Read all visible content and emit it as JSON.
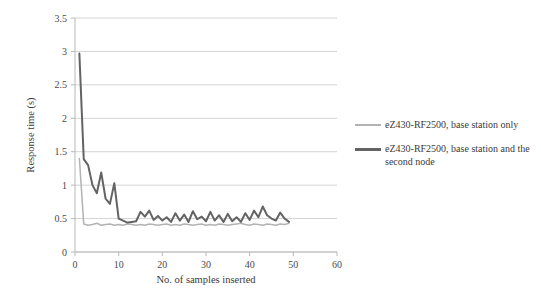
{
  "chart_data": {
    "type": "line",
    "title": "",
    "xlabel": "No. of samples inserted",
    "ylabel": "Response time (s)",
    "xlim": [
      0,
      60
    ],
    "ylim": [
      0,
      3.5
    ],
    "xticks": [
      "0",
      "10",
      "20",
      "30",
      "40",
      "50",
      "60"
    ],
    "xtick_values": [
      0,
      10,
      20,
      30,
      40,
      50,
      60
    ],
    "yticks": [
      "0",
      "0.5",
      "1",
      "1.5",
      "2",
      "2.5",
      "3",
      "3.5"
    ],
    "ytick_values": [
      0,
      0.5,
      1,
      1.5,
      2,
      2.5,
      3,
      3.5
    ],
    "grid": "horizontal",
    "legend_position": "right",
    "series": [
      {
        "name": "eZ430-RF2500, base station only",
        "color": "#b3b3b3",
        "width": 1.5,
        "x": [
          1,
          2,
          3,
          4,
          5,
          6,
          7,
          8,
          9,
          10,
          11,
          12,
          13,
          14,
          15,
          16,
          17,
          18,
          19,
          20,
          21,
          22,
          23,
          24,
          25,
          26,
          27,
          28,
          29,
          30,
          31,
          32,
          33,
          34,
          35,
          36,
          37,
          38,
          39,
          40,
          41,
          42,
          43,
          44,
          45,
          46,
          47,
          48,
          49
        ],
        "values": [
          1.4,
          0.42,
          0.4,
          0.41,
          0.43,
          0.4,
          0.41,
          0.42,
          0.4,
          0.41,
          0.4,
          0.42,
          0.41,
          0.4,
          0.41,
          0.4,
          0.42,
          0.41,
          0.4,
          0.41,
          0.42,
          0.4,
          0.41,
          0.4,
          0.42,
          0.41,
          0.4,
          0.41,
          0.42,
          0.4,
          0.41,
          0.4,
          0.42,
          0.41,
          0.4,
          0.41,
          0.42,
          0.43,
          0.41,
          0.4,
          0.42,
          0.41,
          0.4,
          0.42,
          0.41,
          0.4,
          0.42,
          0.41,
          0.43
        ]
      },
      {
        "name": "eZ430-RF2500, base station and the second node",
        "color": "#636363",
        "width": 2.0,
        "x": [
          1,
          2,
          3,
          4,
          5,
          6,
          7,
          8,
          9,
          10,
          11,
          12,
          13,
          14,
          15,
          16,
          17,
          18,
          19,
          20,
          21,
          22,
          23,
          24,
          25,
          26,
          27,
          28,
          29,
          30,
          31,
          32,
          33,
          34,
          35,
          36,
          37,
          38,
          39,
          40,
          41,
          42,
          43,
          44,
          45,
          46,
          47,
          48,
          49
        ],
        "values": [
          2.97,
          1.39,
          1.3,
          1.0,
          0.88,
          1.19,
          0.8,
          0.72,
          1.03,
          0.5,
          0.47,
          0.44,
          0.45,
          0.46,
          0.6,
          0.53,
          0.62,
          0.48,
          0.54,
          0.47,
          0.52,
          0.45,
          0.58,
          0.47,
          0.56,
          0.45,
          0.61,
          0.49,
          0.53,
          0.46,
          0.6,
          0.47,
          0.55,
          0.45,
          0.57,
          0.46,
          0.52,
          0.45,
          0.58,
          0.48,
          0.62,
          0.52,
          0.68,
          0.55,
          0.5,
          0.47,
          0.59,
          0.5,
          0.45
        ]
      }
    ]
  },
  "legend": {
    "entries": [
      {
        "label": "eZ430-RF2500, base station only",
        "color": "#b3b3b3",
        "weight": "thin"
      },
      {
        "label": "eZ430-RF2500, base station and the second node",
        "color": "#636363",
        "weight": "thick"
      }
    ]
  },
  "axes": {
    "x_title": "No. of samples inserted",
    "y_title": "Response time (s)"
  },
  "colors": {
    "series_light": "#b3b3b3",
    "series_dark": "#636363",
    "grid": "#d4d4d4",
    "axis": "#b8b8b8",
    "text": "#3a3a3a"
  }
}
